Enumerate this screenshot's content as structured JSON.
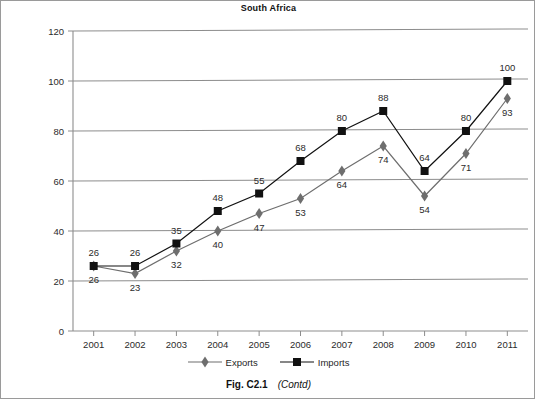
{
  "chart_data": {
    "type": "line",
    "title": "South Africa",
    "xlabel": "",
    "ylabel": "",
    "x": [
      "2001",
      "2002",
      "2003",
      "2004",
      "2005",
      "2006",
      "2007",
      "2008",
      "2009",
      "2010",
      "2011"
    ],
    "categories": [
      "2001",
      "2002",
      "2003",
      "2004",
      "2005",
      "2006",
      "2007",
      "2008",
      "2009",
      "2010",
      "2011"
    ],
    "ylim": [
      0,
      120
    ],
    "yticks": [
      0,
      20,
      40,
      60,
      80,
      100,
      120
    ],
    "grid": true,
    "legend_position": "bottom",
    "series": [
      {
        "name": "Exports",
        "marker": "diamond",
        "color": "#6e6e6e",
        "values": [
          26,
          23,
          32,
          40,
          47,
          53,
          64,
          74,
          54,
          71,
          93
        ],
        "label_positions": [
          "below",
          "below",
          "below",
          "below",
          "below",
          "below",
          "below",
          "below",
          "below",
          "below",
          "below"
        ]
      },
      {
        "name": "Imports",
        "marker": "square",
        "color": "#111111",
        "values": [
          26,
          26,
          35,
          48,
          55,
          68,
          80,
          88,
          64,
          80,
          100
        ],
        "label_positions": [
          "above",
          "above",
          "above",
          "above",
          "above",
          "above",
          "above",
          "above",
          "above",
          "above",
          "above"
        ]
      }
    ]
  },
  "caption": {
    "figure_number": "Fig. C2.1",
    "contd": "(Contd)"
  }
}
